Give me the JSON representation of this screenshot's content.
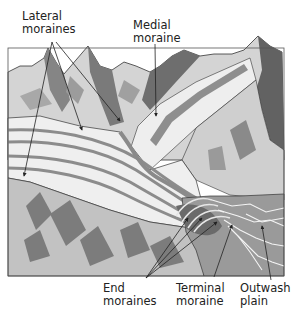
{
  "diagram": {
    "colors": {
      "background": "#ffffff",
      "ice_light": "#f2f2f2",
      "ice_mid": "#dcdcdc",
      "moraine_band": "#8c8c8c",
      "mountain_light": "#d2d2d2",
      "mountain_dark": "#7a7a7a",
      "mountain_darker": "#5e5e5e",
      "plain": "#9a9a9a",
      "lowland": "#bdbdbd",
      "stream": "#f4f4f4",
      "outline": "#333333",
      "label_text": "#222222"
    },
    "labels": {
      "lateral_moraines": "Lateral\nmoraines",
      "medial_moraine": "Medial\nmoraine",
      "end_moraines": "End\nmoraines",
      "terminal_moraine": "Terminal\nmoraine",
      "outwash_plain": "Outwash\nplain"
    }
  }
}
